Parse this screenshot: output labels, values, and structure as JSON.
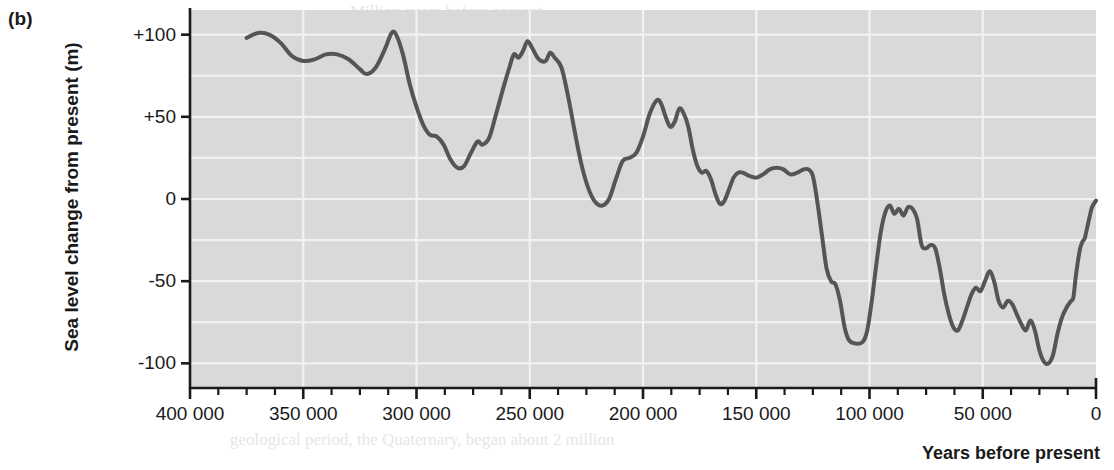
{
  "figure": {
    "panel_label": "(b)",
    "y_axis_title": "Sea level change from present (m)",
    "x_axis_title": "Years before present"
  },
  "annotations": [
    {
      "name": "cromerian",
      "line1": "Cromerian",
      "line2": "interglacial",
      "x_year": 285000,
      "y_m": 46
    },
    {
      "name": "hoxnian",
      "line1": "Hoxnian",
      "line2": "interglacial",
      "x_year": 170000,
      "y_m": -18
    },
    {
      "name": "ipswichian",
      "line1": "Ipswichian",
      "line2": "interglacial",
      "x_year": 92000,
      "y_m": -86
    }
  ],
  "background_bleed": [
    {
      "text": "Million years before present",
      "x": 350,
      "y": 2
    },
    {
      "text": "Figure 4.2  Global sea level change during the last 400 000 years",
      "x": 238,
      "y": 57
    },
    {
      "text": "land and ice-sheet mass, whereas low sea levels",
      "x": 520,
      "y": 148
    },
    {
      "text": "indicate greater volumes of ice on land. Changes in",
      "x": 510,
      "y": 176
    },
    {
      "text": "sea level are thus a proxy record of global ice volume",
      "x": 500,
      "y": 204
    },
    {
      "text": "and, by inference, global climate.",
      "x": 520,
      "y": 232
    },
    {
      "text": "geological period, the Quaternary, began about 2 million",
      "x": 230,
      "y": 430
    }
  ],
  "chart_data": {
    "type": "line",
    "xlabel": "Years before present",
    "ylabel": "Sea level change from present (m)",
    "xlim": [
      400000,
      0
    ],
    "ylim": [
      -115,
      115
    ],
    "x_ticks_major": [
      400000,
      350000,
      300000,
      250000,
      200000,
      150000,
      100000,
      50000,
      0
    ],
    "x_tick_labels": [
      "400 000",
      "350 000",
      "300 000",
      "250 000",
      "200 000",
      "150 000",
      "100 000",
      "50 000",
      "0"
    ],
    "x_tick_minor_step": 12500,
    "y_ticks": [
      100,
      50,
      0,
      -50,
      -100
    ],
    "y_tick_labels": [
      "+100",
      "+50",
      "0",
      "-50",
      "-100"
    ],
    "grid": {
      "horizontal_step_m": 25,
      "vertical_step_years": 50000,
      "color": "#f2f2f2"
    },
    "plot_background": "#d9d9d9",
    "line_color": "#555555",
    "line_width_px": 4,
    "units": {
      "x": "years before present",
      "y": "metres"
    },
    "series": [
      {
        "name": "Sea level change from present",
        "points": [
          [
            375000,
            98
          ],
          [
            370000,
            101
          ],
          [
            365000,
            100
          ],
          [
            360000,
            95
          ],
          [
            355000,
            87
          ],
          [
            350000,
            84
          ],
          [
            345000,
            85
          ],
          [
            340000,
            88
          ],
          [
            335000,
            88
          ],
          [
            330000,
            85
          ],
          [
            325000,
            79
          ],
          [
            322000,
            76
          ],
          [
            318000,
            80
          ],
          [
            314000,
            91
          ],
          [
            311000,
            101
          ],
          [
            309000,
            100
          ],
          [
            306000,
            88
          ],
          [
            303000,
            70
          ],
          [
            300000,
            56
          ],
          [
            297000,
            45
          ],
          [
            294000,
            39
          ],
          [
            291000,
            38
          ],
          [
            288000,
            33
          ],
          [
            285000,
            24
          ],
          [
            282000,
            19
          ],
          [
            279000,
            20
          ],
          [
            276000,
            28
          ],
          [
            273000,
            35
          ],
          [
            271000,
            33
          ],
          [
            268000,
            37
          ],
          [
            265000,
            51
          ],
          [
            262000,
            66
          ],
          [
            259000,
            80
          ],
          [
            257000,
            88
          ],
          [
            255000,
            86
          ],
          [
            253000,
            90
          ],
          [
            251000,
            96
          ],
          [
            249000,
            92
          ],
          [
            246000,
            85
          ],
          [
            243000,
            84
          ],
          [
            241000,
            89
          ],
          [
            239000,
            86
          ],
          [
            236000,
            80
          ],
          [
            233000,
            62
          ],
          [
            230000,
            40
          ],
          [
            227000,
            20
          ],
          [
            224000,
            6
          ],
          [
            221000,
            -2
          ],
          [
            218000,
            -4
          ],
          [
            215000,
            0
          ],
          [
            212000,
            12
          ],
          [
            209000,
            23
          ],
          [
            206000,
            25
          ],
          [
            203000,
            28
          ],
          [
            200000,
            38
          ],
          [
            197000,
            52
          ],
          [
            194000,
            60
          ],
          [
            192000,
            58
          ],
          [
            190000,
            50
          ],
          [
            188000,
            44
          ],
          [
            186000,
            47
          ],
          [
            184000,
            55
          ],
          [
            182000,
            52
          ],
          [
            180000,
            44
          ],
          [
            178000,
            30
          ],
          [
            176000,
            20
          ],
          [
            174000,
            16
          ],
          [
            172000,
            17
          ],
          [
            170000,
            12
          ],
          [
            168000,
            3
          ],
          [
            166000,
            -3
          ],
          [
            164000,
            -1
          ],
          [
            162000,
            6
          ],
          [
            160000,
            13
          ],
          [
            158000,
            16
          ],
          [
            156000,
            16
          ],
          [
            153000,
            14
          ],
          [
            150000,
            13
          ],
          [
            147000,
            15
          ],
          [
            144000,
            18
          ],
          [
            141000,
            19
          ],
          [
            138000,
            18
          ],
          [
            135000,
            15
          ],
          [
            132000,
            16
          ],
          [
            129000,
            18
          ],
          [
            127000,
            18
          ],
          [
            125000,
            14
          ],
          [
            123000,
            -2
          ],
          [
            121000,
            -22
          ],
          [
            119000,
            -42
          ],
          [
            117000,
            -50
          ],
          [
            115000,
            -52
          ],
          [
            113000,
            -62
          ],
          [
            111000,
            -78
          ],
          [
            109000,
            -86
          ],
          [
            106000,
            -88
          ],
          [
            103000,
            -87
          ],
          [
            101000,
            -80
          ],
          [
            99000,
            -62
          ],
          [
            97000,
            -40
          ],
          [
            95000,
            -20
          ],
          [
            93000,
            -8
          ],
          [
            91000,
            -4
          ],
          [
            89000,
            -9
          ],
          [
            87000,
            -6
          ],
          [
            85000,
            -10
          ],
          [
            83000,
            -5
          ],
          [
            81000,
            -6
          ],
          [
            79000,
            -12
          ],
          [
            77000,
            -28
          ],
          [
            75000,
            -30
          ],
          [
            73000,
            -28
          ],
          [
            71000,
            -30
          ],
          [
            69000,
            -42
          ],
          [
            67000,
            -58
          ],
          [
            65000,
            -70
          ],
          [
            63000,
            -78
          ],
          [
            61000,
            -80
          ],
          [
            59000,
            -74
          ],
          [
            57000,
            -66
          ],
          [
            55000,
            -58
          ],
          [
            53000,
            -54
          ],
          [
            51000,
            -56
          ],
          [
            49000,
            -50
          ],
          [
            47000,
            -44
          ],
          [
            45000,
            -50
          ],
          [
            43000,
            -62
          ],
          [
            41000,
            -66
          ],
          [
            39000,
            -62
          ],
          [
            37000,
            -64
          ],
          [
            35000,
            -70
          ],
          [
            33000,
            -76
          ],
          [
            31000,
            -80
          ],
          [
            29000,
            -74
          ],
          [
            27000,
            -80
          ],
          [
            25000,
            -92
          ],
          [
            23000,
            -99
          ],
          [
            21000,
            -100
          ],
          [
            19000,
            -95
          ],
          [
            17000,
            -82
          ],
          [
            15000,
            -72
          ],
          [
            13000,
            -66
          ],
          [
            11000,
            -62
          ],
          [
            10000,
            -60
          ],
          [
            9000,
            -48
          ],
          [
            8000,
            -38
          ],
          [
            7000,
            -30
          ],
          [
            6000,
            -26
          ],
          [
            5000,
            -24
          ],
          [
            4000,
            -18
          ],
          [
            3000,
            -12
          ],
          [
            2000,
            -6
          ],
          [
            1000,
            -3
          ],
          [
            0,
            -1
          ]
        ]
      }
    ]
  }
}
